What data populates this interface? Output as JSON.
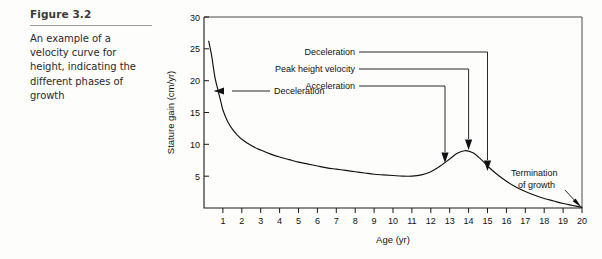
{
  "figure": {
    "number": "Figure 3.2",
    "caption": "An example of a velocity curve for height, indicating the different phases of growth"
  },
  "chart_data": {
    "type": "line",
    "title": "",
    "xlabel": "Age (yr)",
    "ylabel": "Stature gain (cm/yr)",
    "xlim": [
      0,
      20
    ],
    "ylim": [
      0,
      30
    ],
    "xticks": [
      "1",
      "2",
      "3",
      "4",
      "5",
      "6",
      "7",
      "8",
      "9",
      "10",
      "11",
      "12",
      "13",
      "14",
      "15",
      "16",
      "17",
      "18",
      "19",
      "20"
    ],
    "yticks": [
      "5",
      "10",
      "15",
      "20",
      "25",
      "30"
    ],
    "grid": false,
    "legend": "none",
    "series": [
      {
        "name": "Stature velocity",
        "x": [
          0.25,
          0.4,
          0.5,
          0.6,
          0.75,
          0.9,
          1.0,
          1.25,
          1.5,
          1.75,
          2.0,
          2.5,
          3.0,
          3.5,
          4.0,
          4.5,
          5.0,
          5.5,
          6.0,
          6.5,
          7.0,
          7.5,
          8.0,
          8.5,
          9.0,
          9.5,
          10.0,
          10.5,
          11.0,
          11.5,
          12.0,
          12.5,
          13.0,
          13.4,
          13.8,
          14.2,
          14.6,
          15.0,
          15.5,
          16.0,
          16.5,
          17.0,
          17.5,
          18.0,
          18.5,
          19.0,
          19.5,
          20.0
        ],
        "y": [
          26.2,
          24.0,
          22.0,
          20.2,
          18.4,
          16.6,
          15.4,
          13.6,
          12.4,
          11.5,
          10.8,
          9.8,
          9.1,
          8.5,
          8.0,
          7.6,
          7.2,
          6.9,
          6.6,
          6.3,
          6.1,
          5.9,
          5.7,
          5.5,
          5.3,
          5.2,
          5.1,
          5.0,
          5.0,
          5.2,
          5.7,
          6.6,
          7.7,
          8.6,
          9.0,
          8.7,
          7.8,
          6.6,
          5.3,
          4.2,
          3.3,
          2.6,
          2.0,
          1.5,
          1.1,
          0.7,
          0.4,
          0.1
        ]
      }
    ],
    "annotations": [
      {
        "label": "Deceleration",
        "target_x": 0.55,
        "target_y": 18.3,
        "note": "infancy deceleration, arrow pointing left-to-curve"
      },
      {
        "label": "Acceleration",
        "target_x": 12.7,
        "target_y": 7.4
      },
      {
        "label": "Peak height velocity",
        "target_x": 13.8,
        "target_y": 9.0
      },
      {
        "label": "Deceleration",
        "target_x": 15.0,
        "target_y": 6.6
      },
      {
        "label": "Termination of growth",
        "target_x": 20.0,
        "target_y": 0.1
      }
    ]
  },
  "annotation_text": {
    "infancy_deceleration": "Deceleration",
    "acceleration": "Acceleration",
    "peak_height_velocity": "Peak height velocity",
    "puberty_deceleration": "Deceleration",
    "termination_line1": "Termination",
    "termination_line2": "of growth"
  },
  "colors": {
    "ink": "#111111",
    "frame": "#4a4a4a",
    "rule": "#9a9a9a",
    "background": "#fdfdfc"
  }
}
